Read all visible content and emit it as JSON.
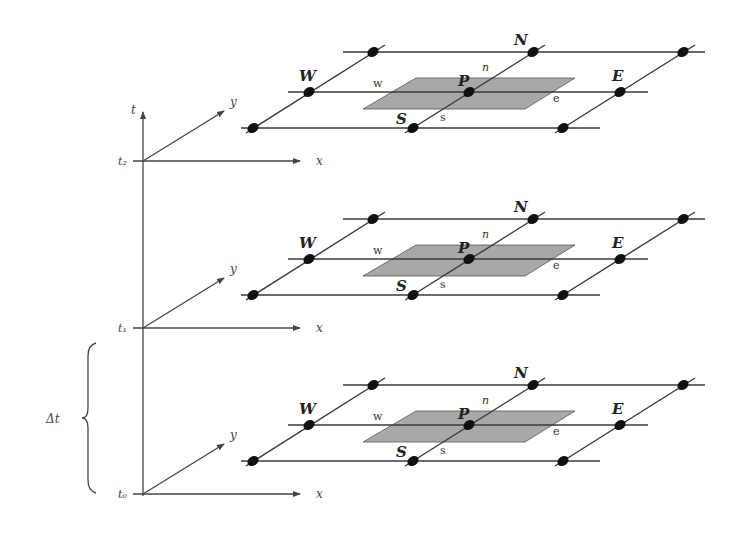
{
  "figure": {
    "time_axis_label": "t",
    "x_axis_label": "x",
    "y_axis_label": "y",
    "delta_label": "Δt",
    "colors": {
      "line": "#3a3a3a",
      "node": "#111111",
      "control_volume": "#a8a8a8",
      "background": "#ffffff"
    },
    "layers": [
      {
        "time_label": "t₂",
        "node_labels": {
          "north": "N",
          "west": "W",
          "center": "P",
          "east": "E",
          "south": "S"
        },
        "face_labels": {
          "north": "n",
          "west": "w",
          "east": "e",
          "south": "s"
        }
      },
      {
        "time_label": "t₁",
        "node_labels": {
          "north": "N",
          "west": "W",
          "center": "P",
          "east": "E",
          "south": "S"
        },
        "face_labels": {
          "north": "n",
          "west": "w",
          "east": "e",
          "south": "s"
        }
      },
      {
        "time_label": "t₀",
        "node_labels": {
          "north": "N",
          "west": "W",
          "center": "P",
          "east": "E",
          "south": "S"
        },
        "face_labels": {
          "north": "n",
          "west": "w",
          "east": "e",
          "south": "s"
        }
      }
    ]
  }
}
